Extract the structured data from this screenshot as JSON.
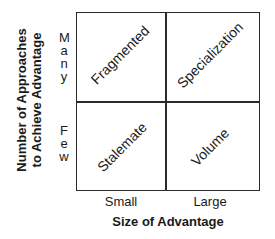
{
  "diagram": {
    "y_axis": {
      "title_line1": "Number of Approaches",
      "title_line2": "to Achieve Advantage",
      "levels": {
        "top": "Many",
        "bottom": "Few"
      }
    },
    "x_axis": {
      "title": "Size of Advantage",
      "levels": {
        "left": "Small",
        "right": "Large"
      }
    },
    "quadrants": {
      "top_left": "Fragmented",
      "top_right": "Specialization",
      "bottom_left": "Stalemate",
      "bottom_right": "Volume"
    },
    "colors": {
      "line": "#2a2a2a",
      "text": "#1a1a1a",
      "background": "#ffffff"
    }
  }
}
